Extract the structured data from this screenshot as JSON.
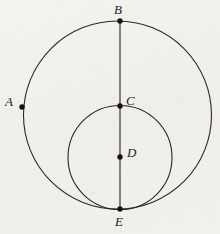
{
  "figure": {
    "kind": "geometry-diagram",
    "background_color": "#f1f0ec",
    "stroke_color": "#2a2725",
    "point_color": "#141312",
    "stroke_width": 1.1,
    "canvas": {
      "width": 220,
      "height": 234
    },
    "shapes": [
      {
        "name": "large-circle",
        "type": "circle",
        "cx": 117.5,
        "cy": 115,
        "r": 94
      },
      {
        "name": "small-circle",
        "type": "circle",
        "cx": 120,
        "cy": 157.5,
        "r": 52
      },
      {
        "name": "diameter-segment-BE",
        "type": "segment",
        "x1": 120,
        "y1": 21,
        "x2": 120,
        "y2": 209
      }
    ],
    "points": [
      {
        "name": "point-b",
        "label": "B",
        "x": 120,
        "y": 21,
        "label_x": 114,
        "label_y": 3,
        "radius": 2.7
      },
      {
        "name": "point-a",
        "label": "A",
        "x": 22,
        "y": 107,
        "label_x": 5,
        "label_y": 95,
        "radius": 2.7
      },
      {
        "name": "point-c",
        "label": "C",
        "x": 120,
        "y": 106,
        "label_x": 126,
        "label_y": 94,
        "radius": 2.7
      },
      {
        "name": "point-d",
        "label": "D",
        "x": 120,
        "y": 157,
        "label_x": 127,
        "label_y": 146,
        "radius": 2.7
      },
      {
        "name": "point-e",
        "label": "E",
        "x": 120,
        "y": 209,
        "label_x": 115,
        "label_y": 215,
        "radius": 2.7
      }
    ]
  }
}
